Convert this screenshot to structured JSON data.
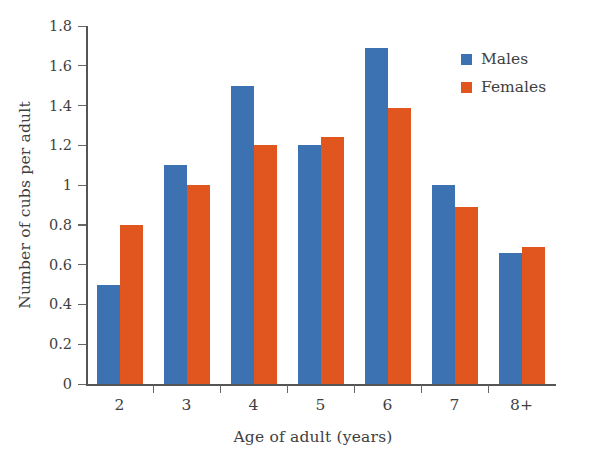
{
  "chart_data": {
    "type": "bar",
    "title": "",
    "xlabel": "Age of adult (years)",
    "ylabel": "Number of cubs per adult",
    "categories": [
      "2",
      "3",
      "4",
      "5",
      "6",
      "7",
      "8+"
    ],
    "series": [
      {
        "name": "Males",
        "color": "#3c72b2",
        "values": [
          0.5,
          1.1,
          1.5,
          1.2,
          1.69,
          1.0,
          0.66
        ]
      },
      {
        "name": "Females",
        "color": "#e1551f",
        "values": [
          0.8,
          1.0,
          1.2,
          1.24,
          1.39,
          0.89,
          0.69
        ]
      }
    ],
    "ylim": [
      0,
      1.8
    ],
    "yticks": [
      "0",
      "0.2",
      "0.4",
      "0.6",
      "0.8",
      "1",
      "1.2",
      "1.4",
      "1.6",
      "1.8"
    ],
    "ytick_values": [
      0,
      0.2,
      0.4,
      0.6,
      0.8,
      1.0,
      1.2,
      1.4,
      1.6,
      1.8
    ],
    "grid": false,
    "legend_position": "top-right"
  },
  "legend": {
    "items": [
      {
        "label": "Males",
        "color": "#3c72b2"
      },
      {
        "label": "Females",
        "color": "#e1551f"
      }
    ]
  },
  "axes": {
    "x_title": "Age of adult (years)",
    "y_title": "Number of cubs per adult"
  }
}
